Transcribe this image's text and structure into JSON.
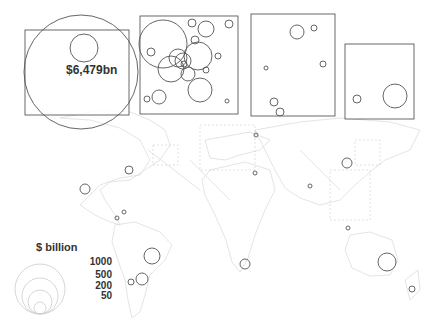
{
  "map": {
    "headline_value": "$6,479bn",
    "legend": {
      "title": "$ billion",
      "values": [
        "1000",
        "500",
        "200",
        "50"
      ]
    },
    "colors": {
      "bubble_stroke": "#555555",
      "legend_stroke": "#cccccc",
      "inset_border": "#444444",
      "coastline": "#d0d0d0",
      "text": "#333333"
    },
    "insets": [
      {
        "name": "north-america-inset",
        "x": 25,
        "y": 30,
        "w": 104,
        "h": 85
      },
      {
        "name": "europe-inset",
        "x": 140,
        "y": 16,
        "w": 98,
        "h": 98
      },
      {
        "name": "southeast-asia-inset",
        "x": 251,
        "y": 14,
        "w": 84,
        "h": 102
      },
      {
        "name": "east-asia-inset",
        "x": 345,
        "y": 44,
        "w": 69,
        "h": 75
      }
    ],
    "bubbles": [
      {
        "cx": 81,
        "cy": 72,
        "r": 57
      },
      {
        "cx": 84,
        "cy": 48,
        "r": 14
      },
      {
        "cx": 163,
        "cy": 44,
        "r": 24
      },
      {
        "cx": 151,
        "cy": 52,
        "r": 4
      },
      {
        "cx": 192,
        "cy": 23,
        "r": 4
      },
      {
        "cx": 206,
        "cy": 29,
        "r": 8
      },
      {
        "cx": 229,
        "cy": 24,
        "r": 4
      },
      {
        "cx": 195,
        "cy": 40,
        "r": 4
      },
      {
        "cx": 198,
        "cy": 56,
        "r": 14
      },
      {
        "cx": 178,
        "cy": 58,
        "r": 9
      },
      {
        "cx": 183,
        "cy": 61,
        "r": 8
      },
      {
        "cx": 171,
        "cy": 69,
        "r": 13
      },
      {
        "cx": 184,
        "cy": 64,
        "r": 3
      },
      {
        "cx": 188,
        "cy": 74,
        "r": 7
      },
      {
        "cx": 206,
        "cy": 70,
        "r": 3
      },
      {
        "cx": 218,
        "cy": 56,
        "r": 3
      },
      {
        "cx": 200,
        "cy": 90,
        "r": 12
      },
      {
        "cx": 159,
        "cy": 97,
        "r": 7
      },
      {
        "cx": 147,
        "cy": 99,
        "r": 3
      },
      {
        "cx": 227,
        "cy": 101,
        "r": 2
      },
      {
        "cx": 297,
        "cy": 32,
        "r": 7
      },
      {
        "cx": 314,
        "cy": 28,
        "r": 3
      },
      {
        "cx": 266,
        "cy": 68,
        "r": 2
      },
      {
        "cx": 323,
        "cy": 64,
        "r": 3
      },
      {
        "cx": 274,
        "cy": 102,
        "r": 4
      },
      {
        "cx": 280,
        "cy": 112,
        "r": 4
      },
      {
        "cx": 357,
        "cy": 99,
        "r": 4
      },
      {
        "cx": 395,
        "cy": 96,
        "r": 12
      },
      {
        "cx": 129,
        "cy": 170,
        "r": 4
      },
      {
        "cx": 85,
        "cy": 189,
        "r": 5
      },
      {
        "cx": 124,
        "cy": 212,
        "r": 2
      },
      {
        "cx": 117,
        "cy": 218,
        "r": 2
      },
      {
        "cx": 256,
        "cy": 135,
        "r": 2
      },
      {
        "cx": 255,
        "cy": 173,
        "r": 2
      },
      {
        "cx": 310,
        "cy": 186,
        "r": 2
      },
      {
        "cx": 347,
        "cy": 163,
        "r": 5
      },
      {
        "cx": 348,
        "cy": 228,
        "r": 2
      },
      {
        "cx": 152,
        "cy": 256,
        "r": 8
      },
      {
        "cx": 142,
        "cy": 279,
        "r": 6
      },
      {
        "cx": 131,
        "cy": 282,
        "r": 3
      },
      {
        "cx": 245,
        "cy": 264,
        "r": 5
      },
      {
        "cx": 387,
        "cy": 262,
        "r": 9
      },
      {
        "cx": 412,
        "cy": 289,
        "r": 3
      }
    ]
  }
}
